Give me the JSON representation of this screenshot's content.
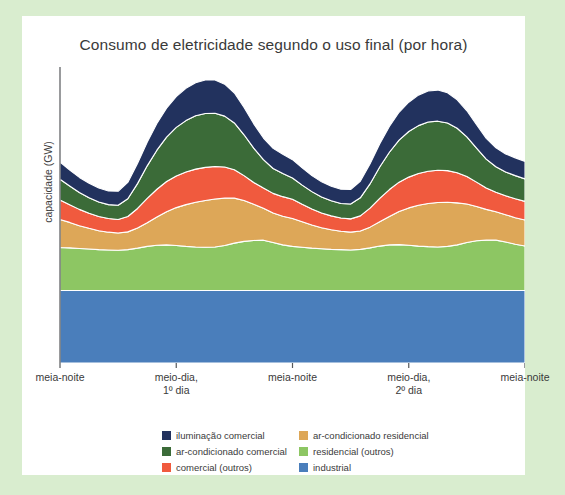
{
  "panel": {
    "background": "#ffffff",
    "page_background": "#d9edcf"
  },
  "chart_data": {
    "type": "area",
    "title": "Consumo de eletricidade segundo o uso final (por hora)",
    "xlabel": "",
    "ylabel": "capacidade (GW)",
    "grid": false,
    "legend_position": "bottom",
    "stacked": true,
    "xlim": [
      0,
      48
    ],
    "ylim": [
      0,
      100
    ],
    "x": [
      0,
      1,
      2,
      3,
      4,
      5,
      6,
      7,
      8,
      9,
      10,
      11,
      12,
      13,
      14,
      15,
      16,
      17,
      18,
      19,
      20,
      21,
      22,
      23,
      24,
      25,
      26,
      27,
      28,
      29,
      30,
      31,
      32,
      33,
      34,
      35,
      36,
      37,
      38,
      39,
      40,
      41,
      42,
      43,
      44,
      45,
      46,
      47,
      48
    ],
    "tick_positions": [
      0,
      12,
      24,
      36,
      48
    ],
    "tick_labels": [
      "meia-noite",
      "meio-dia,\n1º dia",
      "meia-noite",
      "meio-dia,\n2º dia",
      "meia-noite"
    ],
    "series": [
      {
        "name": "industrial",
        "color": "#4a7ebb",
        "values": [
          24.5,
          24.5,
          24.5,
          24.5,
          24.5,
          24.5,
          24.5,
          24.5,
          24.5,
          24.5,
          24.5,
          24.5,
          24.5,
          24.5,
          24.5,
          24.5,
          24.5,
          24.5,
          24.5,
          24.5,
          24.5,
          24.5,
          24.5,
          24.5,
          24.5,
          24.5,
          24.5,
          24.5,
          24.5,
          24.5,
          24.5,
          24.5,
          24.5,
          24.5,
          24.5,
          24.5,
          24.5,
          24.5,
          24.5,
          24.5,
          24.5,
          24.5,
          24.5,
          24.5,
          24.5,
          24.5,
          24.5,
          24.5,
          24.5
        ]
      },
      {
        "name": "residencial (outros)",
        "color": "#8dc663",
        "values": [
          14.5,
          14.4,
          14.2,
          14.0,
          13.8,
          13.7,
          13.6,
          13.8,
          14.3,
          14.9,
          15.3,
          15.4,
          15.2,
          14.9,
          14.7,
          14.6,
          14.7,
          15.2,
          16.0,
          16.6,
          16.9,
          17.0,
          16.2,
          15.4,
          14.9,
          14.6,
          14.3,
          14.1,
          13.9,
          13.8,
          13.7,
          13.9,
          14.4,
          15.0,
          15.4,
          15.5,
          15.3,
          15.0,
          14.8,
          14.7,
          14.9,
          15.4,
          16.2,
          16.8,
          17.0,
          17.0,
          16.4,
          15.6,
          15.0
        ]
      },
      {
        "name": "ar-condicionado residencial",
        "color": "#dda758",
        "values": [
          9.5,
          8.6,
          7.7,
          7.0,
          6.4,
          6.0,
          5.8,
          6.0,
          6.8,
          8.0,
          9.5,
          11.2,
          12.8,
          14.1,
          15.1,
          15.8,
          16.2,
          16.0,
          15.2,
          13.8,
          12.2,
          10.8,
          10.0,
          9.7,
          9.4,
          8.6,
          7.8,
          7.1,
          6.6,
          6.2,
          6.0,
          6.2,
          7.0,
          8.2,
          9.6,
          11.2,
          12.6,
          13.8,
          14.6,
          15.0,
          14.9,
          14.2,
          13.0,
          11.6,
          10.4,
          9.6,
          9.2,
          9.0,
          8.8
        ]
      },
      {
        "name": "comercial (outros)",
        "color": "#f05a3e",
        "values": [
          6.6,
          6.0,
          5.5,
          5.1,
          4.8,
          4.6,
          4.6,
          5.2,
          6.6,
          8.2,
          9.4,
          10.2,
          10.7,
          11.0,
          11.2,
          11.2,
          11.0,
          10.5,
          9.6,
          8.4,
          7.4,
          6.8,
          6.6,
          6.6,
          6.5,
          5.9,
          5.4,
          5.0,
          4.7,
          4.5,
          4.5,
          5.1,
          6.4,
          7.9,
          9.1,
          9.9,
          10.4,
          10.7,
          10.9,
          10.9,
          10.7,
          10.2,
          9.3,
          8.2,
          7.2,
          6.6,
          6.4,
          6.4,
          6.3
        ]
      },
      {
        "name": "ar-condicionado comercial",
        "color": "#3b6b38",
        "values": [
          7.0,
          6.3,
          5.7,
          5.2,
          4.9,
          4.7,
          4.8,
          6.0,
          8.4,
          11.0,
          13.2,
          15.0,
          16.4,
          17.4,
          18.0,
          18.2,
          18.0,
          17.2,
          15.8,
          13.8,
          11.6,
          9.6,
          8.4,
          7.8,
          7.2,
          6.5,
          5.9,
          5.4,
          5.1,
          4.9,
          5.0,
          6.1,
          8.2,
          10.6,
          12.6,
          14.2,
          15.4,
          16.2,
          16.6,
          16.6,
          16.1,
          15.0,
          13.4,
          11.5,
          9.8,
          8.6,
          8.0,
          7.8,
          7.6
        ]
      },
      {
        "name": "iluminação comercial",
        "color": "#22325e",
        "values": [
          5.8,
          5.4,
          5.1,
          4.9,
          4.7,
          4.6,
          4.7,
          5.5,
          6.8,
          8.0,
          9.0,
          9.8,
          10.4,
          10.9,
          11.2,
          11.3,
          11.2,
          10.8,
          10.1,
          9.2,
          8.2,
          7.3,
          6.8,
          6.5,
          6.2,
          5.8,
          5.4,
          5.1,
          4.9,
          4.8,
          4.9,
          5.6,
          6.7,
          7.8,
          8.7,
          9.4,
          9.9,
          10.3,
          10.5,
          10.5,
          10.2,
          9.6,
          8.8,
          7.9,
          7.0,
          6.4,
          6.1,
          6.0,
          5.9
        ]
      }
    ]
  },
  "legend": {
    "columns": [
      {
        "items": [
          {
            "label": "iluminação comercial",
            "color": "#22325e"
          },
          {
            "label": "ar-condicionado comercial",
            "color": "#3b6b38"
          },
          {
            "label": "comercial (outros)",
            "color": "#f05a3e"
          }
        ]
      },
      {
        "items": [
          {
            "label": "ar-condicionado residencial",
            "color": "#dda758"
          },
          {
            "label": "residencial (outros)",
            "color": "#8dc663"
          },
          {
            "label": "industrial",
            "color": "#4a7ebb"
          }
        ]
      }
    ]
  }
}
